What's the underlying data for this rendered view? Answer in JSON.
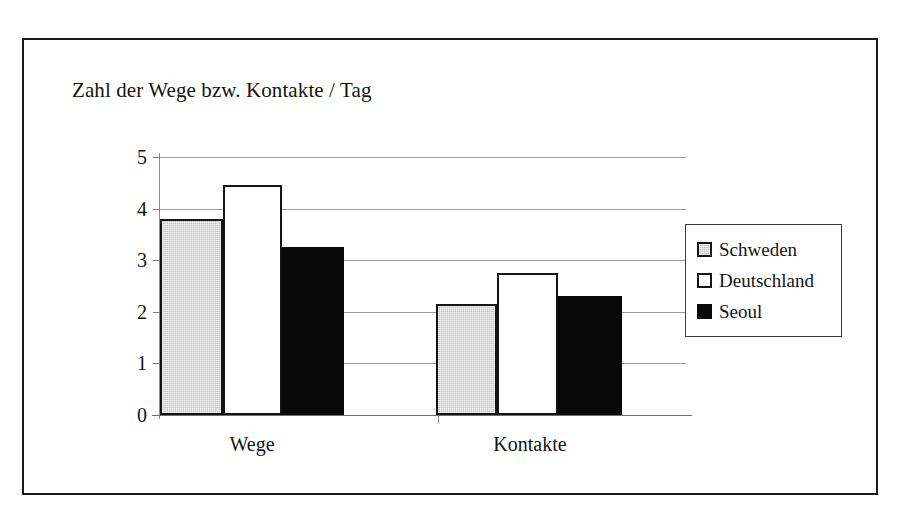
{
  "chart_data": {
    "type": "bar",
    "title": "Zahl der Wege bzw. Kontakte / Tag",
    "xlabel": "",
    "ylabel": "",
    "categories": [
      "Wege",
      "Kontakte"
    ],
    "series": [
      {
        "name": "Schweden",
        "values": [
          3.8,
          2.15
        ],
        "color": "#c3c3c3"
      },
      {
        "name": "Deutschland",
        "values": [
          4.45,
          2.75
        ],
        "color": "#ffffff"
      },
      {
        "name": "Seoul",
        "values": [
          3.25,
          2.3
        ],
        "color": "#090909"
      }
    ],
    "ylim": [
      0,
      5
    ],
    "ytick_labels": [
      "5",
      "4",
      "3",
      "2",
      "1",
      "0"
    ],
    "ytick_values": [
      5,
      4,
      3,
      2,
      1,
      0
    ],
    "grid": true,
    "legend_position": "right",
    "border_color": "#141414",
    "gridline_color": "#9a9a9a"
  }
}
